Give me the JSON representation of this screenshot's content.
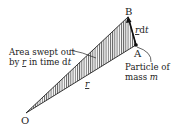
{
  "diagram": {
    "type": "kepler-area-swept",
    "points": {
      "O": {
        "label": "O",
        "x": 26,
        "y": 113
      },
      "A": {
        "label": "A",
        "x": 136,
        "y": 45
      },
      "B": {
        "label": "B",
        "x": 128,
        "y": 17
      }
    },
    "labels": {
      "area_line1": "Area swept out",
      "area_line2_pre": "by ",
      "area_line2_r": "r",
      "area_line2_post": " in time d",
      "area_line2_t": "t",
      "rdot_r": "r",
      "rdot_d": "d",
      "rdot_t": "t",
      "radius": "r",
      "particle_line1": "Particle of",
      "particle_line2_pre": "mass ",
      "particle_line2_m": "m"
    },
    "colors": {
      "ink": "#222222",
      "hatch": "#444444",
      "background": "#ffffff"
    }
  }
}
